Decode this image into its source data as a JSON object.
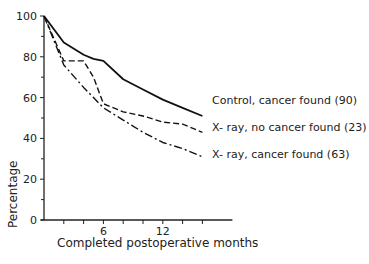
{
  "chart_data": {
    "type": "line",
    "title": "",
    "xlabel": "Completed postoperative months",
    "ylabel": "Percentage",
    "xlim": [
      0,
      16
    ],
    "ylim": [
      0,
      100
    ],
    "x_ticks": [
      0,
      2,
      4,
      6,
      8,
      10,
      12,
      14,
      16
    ],
    "x_tick_labels": [
      {
        "value": 6,
        "label": "6"
      },
      {
        "value": 12,
        "label": "12"
      }
    ],
    "y_tick_labels": [
      "0",
      "20",
      "40",
      "60",
      "80",
      "100"
    ],
    "grid": false,
    "legend_position": "inline-right",
    "x": [
      0,
      2,
      4,
      5,
      6,
      8,
      10,
      12,
      14,
      16
    ],
    "series": [
      {
        "name": "Control, cancer found (90)",
        "style": "solid",
        "values": [
          100,
          87,
          81,
          79,
          78,
          69,
          64,
          59,
          55,
          51
        ]
      },
      {
        "name": "X- ray, no cancer found (23)",
        "style": "dashed",
        "values": [
          100,
          78,
          78,
          70,
          57,
          53,
          51,
          48,
          47,
          43
        ]
      },
      {
        "name": "X- ray, cancer found (63)",
        "style": "dashdot",
        "values": [
          100,
          76,
          65,
          60,
          55,
          49,
          43,
          38,
          35,
          31
        ]
      }
    ]
  }
}
